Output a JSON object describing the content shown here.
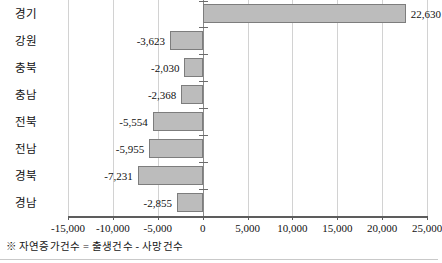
{
  "chart_data": {
    "type": "bar",
    "orientation": "horizontal",
    "title": "",
    "subtitle": "",
    "xlabel": "",
    "ylabel": "",
    "categories": [
      "경기",
      "강원",
      "충북",
      "충남",
      "전북",
      "전남",
      "경북",
      "경남"
    ],
    "values": [
      22630,
      -3623,
      -2030,
      -2368,
      -5554,
      -5955,
      -7231,
      -2855
    ],
    "data_labels": [
      "22,630",
      "-3,623",
      "-2,030",
      "-2,368",
      "-5,554",
      "-5,955",
      "-7,231",
      "-2,855"
    ],
    "xlim": [
      -15000,
      25000
    ],
    "xticks": [
      -15000,
      -10000,
      -5000,
      0,
      5000,
      10000,
      15000,
      20000,
      25000
    ],
    "xtick_labels": [
      "-15,000",
      "-10,000",
      "-5,000",
      "0",
      "5,000",
      "10,000",
      "15,000",
      "20,000",
      "25,000"
    ],
    "grid": true,
    "legend": false,
    "series_name": "자연증가건수",
    "bar_fill_color": "#bcbcbc",
    "bar_border_color": "#7d7d7d",
    "gridline_color": "#d2d2d2",
    "axis_color": "#5d5d5d"
  },
  "footnote": {
    "marker": "※",
    "text": "자연증가건수 = 출생건수 - 사망건수",
    "full": "※ 자연증가건수 = 출생건수 - 사망건수"
  }
}
